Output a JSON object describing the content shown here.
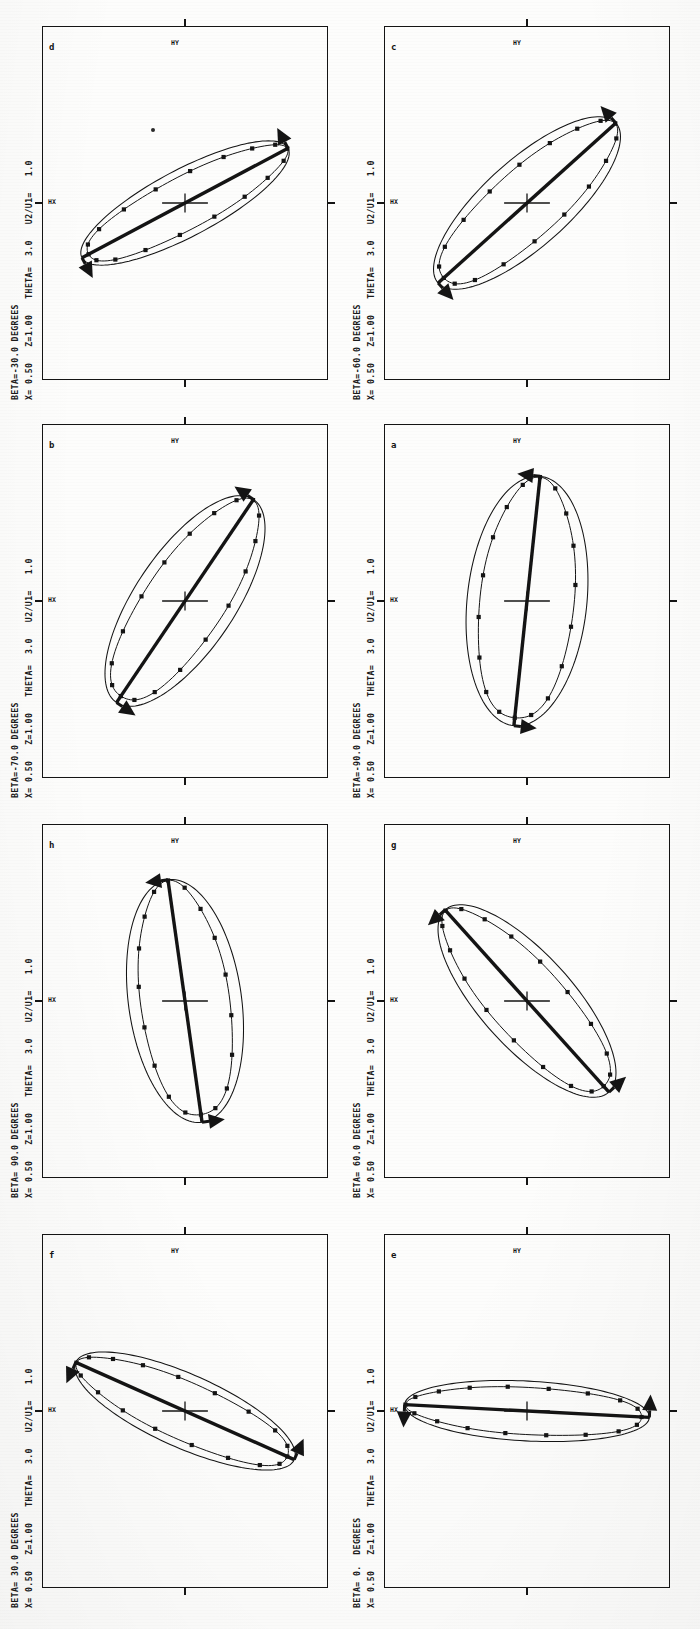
{
  "figure": {
    "kind": "scanned-figure",
    "orientation": "landscape-page-rotated-90-ccw",
    "panel_count": 8,
    "columns": 2,
    "rows": 4,
    "axis_labels": {
      "x": "HY",
      "y": "HX"
    },
    "common": {
      "x_value": "0.50",
      "z_value": "1.00",
      "theta_value": "3.0",
      "u_ratio_value": "1.0",
      "x_prefix": "X=",
      "z_prefix": "Z=",
      "theta_prefix": "THETA=",
      "u_prefix": "U2/U1="
    },
    "colors": {
      "ink": "#141414",
      "paper": "#fdfdfc",
      "curve": "#1a1a1a"
    }
  },
  "panels": [
    {
      "letter": "d",
      "header": "BETA=-30.0 DEGREES",
      "subheader": "X= 0.50   Z=1.00   THETA=  3.0   U2/U1=   1.0",
      "beta_deg": -30.0,
      "axis_x": "HY",
      "axis_y": "HX",
      "ellipse": {
        "tilt_deg": -62,
        "semi_major": 0.8,
        "semi_minor": 0.2,
        "marker_count": 18
      },
      "arrow_ends": "both",
      "stray_dot": true
    },
    {
      "letter": "c",
      "header": "BETA=-60.0 DEGREES",
      "subheader": "X= 0.50   Z=1.00   THETA=  3.0   U2/U1=   1.0",
      "beta_deg": -60.0,
      "axis_x": "HY",
      "axis_y": "HX",
      "ellipse": {
        "tilt_deg": -48,
        "semi_major": 0.82,
        "semi_minor": 0.26,
        "marker_count": 18
      },
      "arrow_ends": "both",
      "stray_dot": false
    },
    {
      "letter": "b",
      "header": "BETA=-70.0 DEGREES",
      "subheader": "X= 0.50   Z=1.00   THETA=  3.0   U2/U1=   1.0",
      "beta_deg": -70.0,
      "axis_x": "HY",
      "axis_y": "HX",
      "ellipse": {
        "tilt_deg": -34,
        "semi_major": 0.84,
        "semi_minor": 0.3,
        "marker_count": 18
      },
      "arrow_ends": "both",
      "stray_dot": false
    },
    {
      "letter": "a",
      "header": "BETA=-90.0 DEGREES",
      "subheader": "X= 0.50   Z=1.00   THETA=  3.0   U2/U1=   1.0",
      "beta_deg": -90.0,
      "axis_x": "HY",
      "axis_y": "HX",
      "ellipse": {
        "tilt_deg": -6,
        "semi_major": 0.86,
        "semi_minor": 0.36,
        "marker_count": 18
      },
      "arrow_ends": "both",
      "stray_dot": false
    },
    {
      "letter": "h",
      "header": "BETA= 90.0 DEGREES",
      "subheader": "X= 0.50   Z=1.00   THETA=  3.0   U2/U1=   1.0",
      "beta_deg": 90.0,
      "axis_x": "HY",
      "axis_y": "HX",
      "ellipse": {
        "tilt_deg": 8,
        "semi_major": 0.84,
        "semi_minor": 0.34,
        "marker_count": 18
      },
      "arrow_ends": "both",
      "stray_dot": false
    },
    {
      "letter": "g",
      "header": "BETA= 60.0 DEGREES",
      "subheader": "X= 0.50   Z=1.00   THETA=  3.0   U2/U1=   1.0",
      "beta_deg": 60.0,
      "axis_x": "HY",
      "axis_y": "HX",
      "ellipse": {
        "tilt_deg": 42,
        "semi_major": 0.84,
        "semi_minor": 0.28,
        "marker_count": 18
      },
      "arrow_ends": "both",
      "stray_dot": false
    },
    {
      "letter": "f",
      "header": "BETA= 30.0 DEGREES",
      "subheader": "X= 0.50   Z=1.00   THETA=  3.0   U2/U1=   1.0",
      "beta_deg": 30.0,
      "axis_x": "HY",
      "axis_y": "HX",
      "ellipse": {
        "tilt_deg": 66,
        "semi_major": 0.82,
        "semi_minor": 0.22,
        "marker_count": 18
      },
      "arrow_ends": "both",
      "stray_dot": false
    },
    {
      "letter": "e",
      "header": "BETA= 0.  DEGREES",
      "subheader": "X= 0.50   Z=1.00   THETA=  3.0   U2/U1=   1.0",
      "beta_deg": 0.0,
      "axis_x": "HY",
      "axis_y": "HX",
      "ellipse": {
        "tilt_deg": 87,
        "semi_major": 0.84,
        "semi_minor": 0.18,
        "marker_count": 18
      },
      "arrow_ends": "both",
      "stray_dot": false
    }
  ],
  "chart_data": {
    "type": "line",
    "xlabel": "HY",
    "ylabel": "HX",
    "xlim": [
      -1,
      1
    ],
    "ylim": [
      -1,
      1
    ],
    "grid": false,
    "legend": "none",
    "series": [
      {
        "name": "BETA=-30.0",
        "panel": "d",
        "tilt_deg": -62,
        "semi_major": 0.8,
        "semi_minor": 0.2
      },
      {
        "name": "BETA=-60.0",
        "panel": "c",
        "tilt_deg": -48,
        "semi_major": 0.82,
        "semi_minor": 0.26
      },
      {
        "name": "BETA=-70.0",
        "panel": "b",
        "tilt_deg": -34,
        "semi_major": 0.84,
        "semi_minor": 0.3
      },
      {
        "name": "BETA=-90.0",
        "panel": "a",
        "tilt_deg": -6,
        "semi_major": 0.86,
        "semi_minor": 0.36
      },
      {
        "name": "BETA= 90.0",
        "panel": "h",
        "tilt_deg": 8,
        "semi_major": 0.84,
        "semi_minor": 0.34
      },
      {
        "name": "BETA= 60.0",
        "panel": "g",
        "tilt_deg": 42,
        "semi_major": 0.84,
        "semi_minor": 0.28
      },
      {
        "name": "BETA= 30.0",
        "panel": "f",
        "tilt_deg": 66,
        "semi_major": 0.82,
        "semi_minor": 0.22
      },
      {
        "name": "BETA= 0.",
        "panel": "e",
        "tilt_deg": 87,
        "semi_major": 0.84,
        "semi_minor": 0.18
      }
    ],
    "constants": {
      "X": 0.5,
      "Z": 1.0,
      "THETA": 3.0,
      "U2_over_U1": 1.0
    }
  }
}
